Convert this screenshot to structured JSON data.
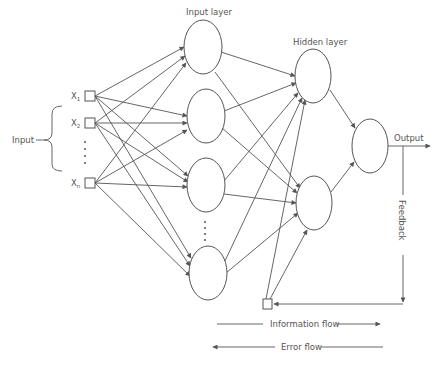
{
  "diagram": {
    "labels": {
      "input_group": "Input",
      "input_layer": "Input layer",
      "hidden_layer": "Hidden layer",
      "output": "Output",
      "feedback": "Feedback",
      "information_flow": "Information flow",
      "error_flow": "Error flow"
    },
    "inputs": [
      {
        "id": "x1",
        "label": "X",
        "sub": "1",
        "x": 85,
        "y": 91
      },
      {
        "id": "x2",
        "label": "X",
        "sub": "2",
        "x": 85,
        "y": 118
      },
      {
        "id": "xn",
        "label": "X",
        "sub": "n",
        "x": 85,
        "y": 178
      }
    ],
    "input_layer_nodes": [
      {
        "id": "i1",
        "cx": 203,
        "cy": 47
      },
      {
        "id": "i2",
        "cx": 206,
        "cy": 116
      },
      {
        "id": "i3",
        "cx": 206,
        "cy": 185
      },
      {
        "id": "i4",
        "cx": 208,
        "cy": 273
      }
    ],
    "hidden_layer_nodes": [
      {
        "id": "h1",
        "cx": 313,
        "cy": 76
      },
      {
        "id": "h2",
        "cx": 314,
        "cy": 203
      }
    ],
    "output_node": {
      "id": "o1",
      "cx": 370,
      "cy": 146
    },
    "feedback_node": {
      "id": "fb",
      "x": 263,
      "y": 299
    },
    "colors": {
      "stroke": "#555555",
      "text": "#555555",
      "background": "#ffffff"
    }
  }
}
